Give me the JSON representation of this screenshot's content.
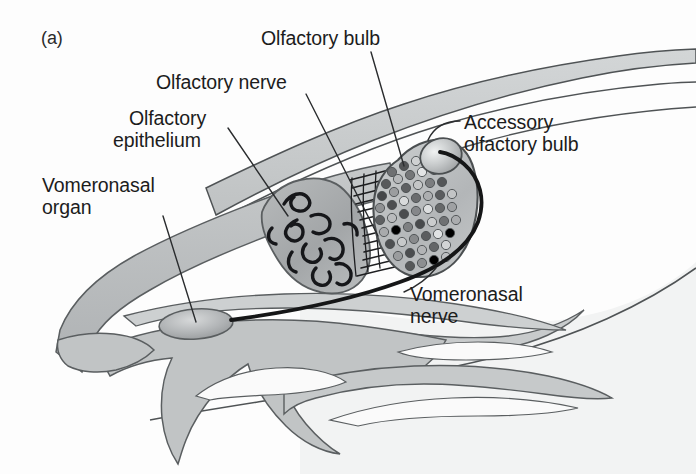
{
  "figure": {
    "panel_tag": "(a)",
    "background_color": "#fdfdfd",
    "ink_color": "#1c1c1c",
    "tissue_fill": "#b9bcbd",
    "tissue_fill_light": "#dcdede",
    "tissue_stroke": "#5a5e60",
    "epithelium_fill": "#a8abac",
    "bulb_fill": "#bdc0c1",
    "accessory_bulb_fill": "#c9cccd",
    "vno_fill": "#b4b7b8",
    "nerve_color": "#1a1a1a"
  },
  "labels": {
    "olfactory_bulb": "Olfactory bulb",
    "olfactory_nerve": "Olfactory nerve",
    "olfactory_epithelium_line1": "Olfactory",
    "olfactory_epithelium_line2": "epithelium",
    "vomeronasal_organ_line1": "Vomeronasal",
    "vomeronasal_organ_line2": "organ",
    "accessory_olfactory_bulb_line1": "Accessory",
    "accessory_olfactory_bulb_line2": "olfactory bulb",
    "vomeronasal_nerve_line1": "Vomeronasal",
    "vomeronasal_nerve_line2": "nerve"
  },
  "structures": [
    {
      "name": "olfactory-bulb",
      "description": "Rounded triangular bulb filled with glomeruli dots"
    },
    {
      "name": "accessory-olfactory-bulb",
      "description": "Small shaded sphere on the dorsal-caudal bulb"
    },
    {
      "name": "olfactory-epithelium",
      "description": "Elongated shaded mass with dark squiggle receptor lines"
    },
    {
      "name": "olfactory-nerve",
      "description": "Bundle of fine parallel fibres from epithelium to bulb"
    },
    {
      "name": "vomeronasal-organ",
      "description": "Small shaded oval in the ventral nasal cavity"
    },
    {
      "name": "vomeronasal-nerve",
      "description": "Thick dark nerve running from the VNO up to the accessory bulb"
    },
    {
      "name": "nasal-turbinates",
      "description": "Scrolled grey nasal conchae in the lower nasal cavity"
    },
    {
      "name": "cranial-outline",
      "description": "Head and skull contour bands"
    }
  ],
  "glomeruli": {
    "shades": [
      "#58595b",
      "#7c7e80",
      "#9a9c9e",
      "#c0c2c4",
      "#e4e6e7"
    ],
    "count": 52
  }
}
